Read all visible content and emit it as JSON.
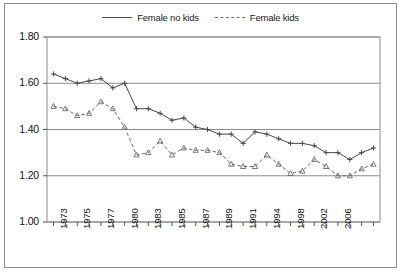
{
  "figure": {
    "background_color": "#ffffff",
    "border_color": "#8c8c8c"
  },
  "legend": {
    "position": "top-center",
    "entries": [
      {
        "label": "Female no kids",
        "style": "solid",
        "color": "#4a4a4a",
        "marker": "cross"
      },
      {
        "label": "Female kids",
        "style": "dashed",
        "color": "#6a6a6a",
        "marker": "triangle"
      }
    ]
  },
  "axes": {
    "y_tick_labels": [
      "1.80",
      "1.60",
      "1.40",
      "1.20",
      "1.00"
    ],
    "x_tick_labels": [
      "1973",
      "1975",
      "1977",
      "1980",
      "1983",
      "1985",
      "1987",
      "1989",
      "1991",
      "1994",
      "1998",
      "2002",
      "2006"
    ],
    "grid": "horizontal",
    "grid_color": "#8c8c8c"
  },
  "chart_data": {
    "type": "line",
    "title": "",
    "subtitle": "",
    "xlabel": "",
    "ylabel": "",
    "ylim": [
      1.0,
      1.8
    ],
    "ytick_step": 0.2,
    "grid": true,
    "legend_position": "top-center",
    "x": [
      1973,
      1974,
      1975,
      1976,
      1977,
      1978,
      1980,
      1981,
      1982,
      1983,
      1984,
      1985,
      1986,
      1987,
      1988,
      1989,
      1990,
      1991,
      1992,
      1993,
      1994,
      1996,
      1998,
      2000,
      2002,
      2004,
      2006,
      2007
    ],
    "x_labeled_ticks": [
      "1973",
      "1975",
      "1977",
      "1980",
      "1983",
      "1985",
      "1987",
      "1989",
      "1991",
      "1994",
      "1998",
      "2002",
      "2006"
    ],
    "series": [
      {
        "name": "Female no kids",
        "style": "solid",
        "color": "#4a4a4a",
        "marker": "cross",
        "values": [
          1.64,
          1.62,
          1.6,
          1.61,
          1.62,
          1.58,
          1.6,
          1.49,
          1.49,
          1.47,
          1.44,
          1.45,
          1.41,
          1.4,
          1.38,
          1.38,
          1.34,
          1.39,
          1.38,
          1.36,
          1.34,
          1.34,
          1.33,
          1.3,
          1.3,
          1.27,
          1.3,
          1.32
        ]
      },
      {
        "name": "Female kids",
        "style": "dashed",
        "color": "#6a6a6a",
        "marker": "triangle",
        "values": [
          1.5,
          1.49,
          1.46,
          1.47,
          1.52,
          1.49,
          1.41,
          1.29,
          1.3,
          1.35,
          1.29,
          1.32,
          1.31,
          1.31,
          1.3,
          1.25,
          1.24,
          1.24,
          1.29,
          1.25,
          1.21,
          1.22,
          1.27,
          1.24,
          1.2,
          1.2,
          1.23,
          1.25
        ]
      }
    ]
  }
}
